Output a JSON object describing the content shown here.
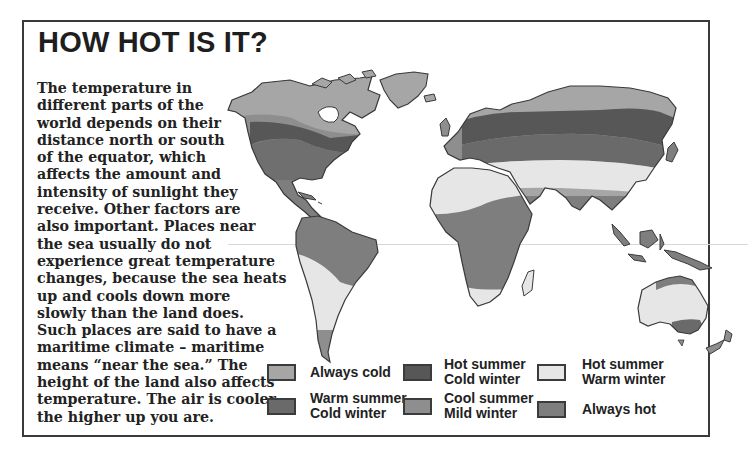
{
  "page": {
    "title": "HOW HOT IS IT?",
    "body_lines": [
      "The temperature in",
      "different parts of the",
      "world depends on their",
      "distance north or south",
      "of the equator, which",
      "affects the amount and",
      "intensity of sunlight they",
      "receive. Other factors are",
      "also important. Places near",
      "the sea usually do not",
      "experience great temperature",
      "changes, because the sea heats",
      "up and cools down more",
      "slowly than the land does.",
      "Such places are said to have a",
      "maritime climate – maritime",
      "means “near the sea.” The",
      "height of the land also affects",
      "temperature. The air is cooler",
      "the higher up you are."
    ]
  },
  "map": {
    "label": "world-climate-map",
    "zone_colors": {
      "always_cold": "#a6a6a6",
      "hot_summer_cold_winter": "#575757",
      "hot_summer_warm_winter": "#e6e6e6",
      "warm_summer_cold_winter": "#6a6a6a",
      "cool_summer_mild_winter": "#8e8e8e",
      "always_hot": "#7e7e7e",
      "outline": "#3a3a3a"
    }
  },
  "legend": {
    "items": [
      {
        "key": "always_cold",
        "lines": [
          "Always cold"
        ],
        "color": "#a6a6a6"
      },
      {
        "key": "hot_summer_cold_winter",
        "lines": [
          "Hot summer",
          "Cold winter"
        ],
        "color": "#575757"
      },
      {
        "key": "hot_summer_warm_winter",
        "lines": [
          "Hot summer",
          "Warm winter"
        ],
        "color": "#e6e6e6"
      },
      {
        "key": "warm_summer_cold_winter",
        "lines": [
          "Warm summer",
          "Cold winter"
        ],
        "color": "#6a6a6a"
      },
      {
        "key": "cool_summer_mild_winter",
        "lines": [
          "Cool summer",
          "Mild winter"
        ],
        "color": "#8e8e8e"
      },
      {
        "key": "always_hot",
        "lines": [
          "Always hot"
        ],
        "color": "#7e7e7e"
      }
    ]
  }
}
